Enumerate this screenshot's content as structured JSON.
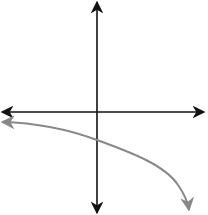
{
  "diagram": {
    "colors": {
      "background": "#ffffff",
      "axis": "#111111",
      "curve": "#888888"
    },
    "axes": {
      "x_axis": {
        "y": 112,
        "x_start": 0,
        "x_end": 204,
        "arrows": [
          "left",
          "right"
        ]
      },
      "y_axis": {
        "x": 97,
        "y_start": 2,
        "y_end": 213,
        "arrows": [
          "up",
          "down"
        ]
      }
    },
    "curve": {
      "start_arrow": "left",
      "end_arrow": "down",
      "points": [
        [
          2,
          122
        ],
        [
          40,
          125
        ],
        [
          70,
          131
        ],
        [
          97,
          140
        ],
        [
          130,
          152
        ],
        [
          160,
          170
        ],
        [
          180,
          190
        ],
        [
          189,
          210
        ]
      ]
    }
  }
}
